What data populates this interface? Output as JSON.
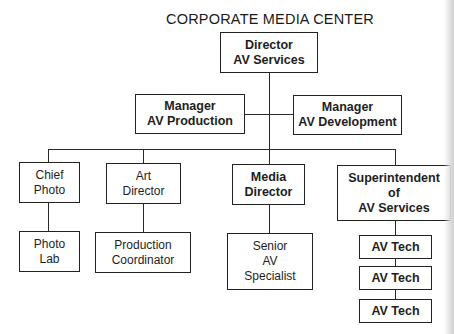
{
  "title": "CORPORATE MEDIA CENTER",
  "nodes": {
    "director": {
      "lines": [
        "Director",
        "AV Services"
      ]
    },
    "mgr_production": {
      "lines": [
        "Manager",
        "AV Production"
      ]
    },
    "mgr_development": {
      "lines": [
        "Manager",
        "AV Development"
      ]
    },
    "chief_photo": {
      "lines": [
        "Chief",
        "Photo"
      ]
    },
    "art_director": {
      "lines": [
        "Art",
        "Director"
      ]
    },
    "media_director": {
      "lines": [
        "Media",
        "Director"
      ]
    },
    "superintendent": {
      "lines": [
        "Superintendent",
        "of",
        "AV Services"
      ]
    },
    "photo_lab": {
      "lines": [
        "Photo",
        "Lab"
      ]
    },
    "production_coordinator": {
      "lines": [
        "Production",
        "Coordinator"
      ]
    },
    "senior_av_specialist": {
      "lines": [
        "Senior",
        "AV",
        "Specialist"
      ]
    },
    "av_tech_1": {
      "lines": [
        "AV Tech"
      ]
    },
    "av_tech_2": {
      "lines": [
        "AV Tech"
      ]
    },
    "av_tech_3": {
      "lines": [
        "AV Tech"
      ]
    }
  },
  "hierarchy": {
    "Director AV Services": [
      "Manager AV Production",
      "Manager AV Development",
      "Chief Photo",
      "Art Director",
      "Media Director",
      "Superintendent of AV Services"
    ],
    "Chief Photo": [
      "Photo Lab"
    ],
    "Art Director": [
      "Production Coordinator"
    ],
    "Media Director": [
      "Senior AV Specialist"
    ],
    "Superintendent of AV Services": [
      "AV Tech",
      "AV Tech",
      "AV Tech"
    ]
  }
}
